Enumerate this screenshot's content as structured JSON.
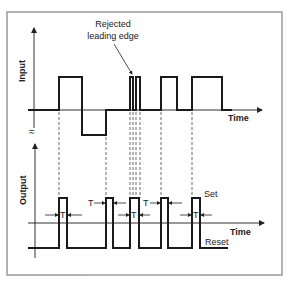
{
  "diagram": {
    "type": "timing-diagram",
    "annotation": {
      "line1": "Rejected",
      "line2": "leading edge"
    },
    "input": {
      "axis_label": "Input",
      "time_label": "Time",
      "break_symbol": "≈",
      "waveform_levels": [
        "baseline",
        "high",
        "low"
      ]
    },
    "output": {
      "axis_label": "Output",
      "time_label": "Time",
      "set_label": "Set",
      "reset_label": "Reset",
      "delay_label": "T",
      "delay_markers": [
        "T",
        "T",
        "T",
        "T",
        "T",
        "T"
      ]
    },
    "colors": {
      "frame": "#9a9a9a",
      "signal": "#1a1a1a",
      "background": "#ffffff"
    }
  }
}
